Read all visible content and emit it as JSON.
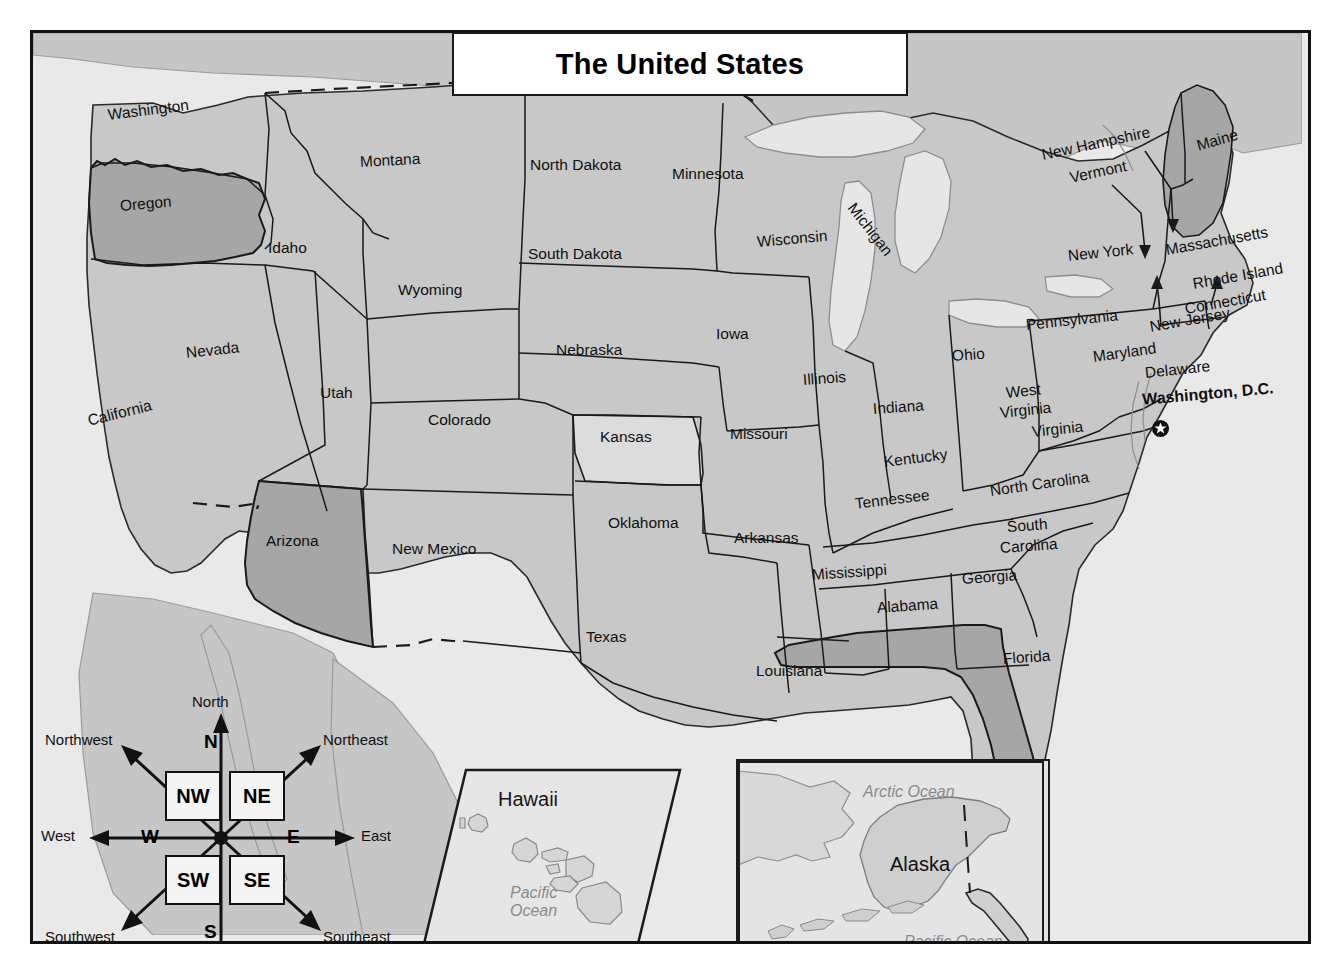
{
  "title": {
    "text": "The United States"
  },
  "colors": {
    "land_base": "#c8c8c8",
    "highlight_state": "#a6a6a6",
    "light_state": "#dcdcdc",
    "ocean": "#e9e9e9",
    "lake": "#e6e6e6",
    "border": "#1a1a1a",
    "ocean_label": "#8a8a8a"
  },
  "states": [
    {
      "name": "Washington",
      "x": 108,
      "y": 106,
      "rot": -7,
      "size": "lbl"
    },
    {
      "name": "Oregon",
      "x": 120,
      "y": 197,
      "rot": -5,
      "size": "lbl"
    },
    {
      "name": "Idaho",
      "x": 268,
      "y": 239,
      "rot": 0,
      "size": "lbl"
    },
    {
      "name": "Montana",
      "x": 360,
      "y": 153,
      "rot": -3,
      "size": "lbl"
    },
    {
      "name": "Wyoming",
      "x": 398,
      "y": 281,
      "rot": 0,
      "size": "lbl"
    },
    {
      "name": "Nevada",
      "x": 186,
      "y": 344,
      "rot": -6,
      "size": "lbl"
    },
    {
      "name": "Utah",
      "x": 320,
      "y": 384,
      "rot": 0,
      "size": "lbl"
    },
    {
      "name": "California",
      "x": 88,
      "y": 412,
      "rot": -14,
      "size": "lbl"
    },
    {
      "name": "Arizona",
      "x": 266,
      "y": 532,
      "rot": 0,
      "size": "lbl"
    },
    {
      "name": "Colorado",
      "x": 428,
      "y": 411,
      "rot": 0,
      "size": "lbl"
    },
    {
      "name": "New Mexico",
      "x": 392,
      "y": 540,
      "rot": 0,
      "size": "lbl"
    },
    {
      "name": "North Dakota",
      "x": 530,
      "y": 156,
      "rot": 0,
      "size": "lbl"
    },
    {
      "name": "South Dakota",
      "x": 528,
      "y": 245,
      "rot": 0,
      "size": "lbl"
    },
    {
      "name": "Nebraska",
      "x": 556,
      "y": 341,
      "rot": 0,
      "size": "lbl"
    },
    {
      "name": "Kansas",
      "x": 600,
      "y": 428,
      "rot": 0,
      "size": "lbl"
    },
    {
      "name": "Oklahoma",
      "x": 608,
      "y": 514,
      "rot": 0,
      "size": "lbl"
    },
    {
      "name": "Texas",
      "x": 586,
      "y": 628,
      "rot": 0,
      "size": "lbl"
    },
    {
      "name": "Minnesota",
      "x": 672,
      "y": 165,
      "rot": 0,
      "size": "lbl"
    },
    {
      "name": "Iowa",
      "x": 716,
      "y": 325,
      "rot": 0,
      "size": "lbl"
    },
    {
      "name": "Missouri",
      "x": 730,
      "y": 425,
      "rot": 0,
      "size": "lbl"
    },
    {
      "name": "Arkansas",
      "x": 734,
      "y": 529,
      "rot": 0,
      "size": "lbl"
    },
    {
      "name": "Louisiana",
      "x": 756,
      "y": 662,
      "rot": 0,
      "size": "lbl"
    },
    {
      "name": "Wisconsin",
      "x": 757,
      "y": 233,
      "rot": -5,
      "size": "lbl"
    },
    {
      "name": "Illinois",
      "x": 803,
      "y": 371,
      "rot": -4,
      "size": "lbl"
    },
    {
      "name": "Michigan",
      "x": 851,
      "y": 196,
      "rot": 52,
      "size": "lbl"
    },
    {
      "name": "Indiana",
      "x": 873,
      "y": 400,
      "rot": -4,
      "size": "lbl"
    },
    {
      "name": "Ohio",
      "x": 952,
      "y": 347,
      "rot": -4,
      "size": "lbl"
    },
    {
      "name": "Kentucky",
      "x": 884,
      "y": 453,
      "rot": -7,
      "size": "lbl"
    },
    {
      "name": "Tennessee",
      "x": 855,
      "y": 495,
      "rot": -7,
      "size": "lbl"
    },
    {
      "name": "Mississippi",
      "x": 812,
      "y": 566,
      "rot": -4,
      "size": "lbl"
    },
    {
      "name": "Alabama",
      "x": 877,
      "y": 599,
      "rot": -4,
      "size": "lbl"
    },
    {
      "name": "Georgia",
      "x": 962,
      "y": 570,
      "rot": -4,
      "size": "lbl"
    },
    {
      "name": "Florida",
      "x": 1003,
      "y": 650,
      "rot": -4,
      "size": "lbl"
    },
    {
      "name": "South",
      "x": 1007,
      "y": 518,
      "rot": -4,
      "size": "lbl"
    },
    {
      "name": "Carolina",
      "x": 1000,
      "y": 539,
      "rot": -4,
      "size": "lbl"
    },
    {
      "name": "North Carolina",
      "x": 990,
      "y": 482,
      "rot": -8,
      "size": "lbl"
    },
    {
      "name": "Virginia",
      "x": 1032,
      "y": 423,
      "rot": -6,
      "size": "lbl"
    },
    {
      "name": "West",
      "x": 1006,
      "y": 384,
      "rot": -6,
      "size": "lbl"
    },
    {
      "name": "Virginia",
      "x": 1000,
      "y": 404,
      "rot": -6,
      "size": "lbl"
    },
    {
      "name": "Pennsylvania",
      "x": 1026,
      "y": 316,
      "rot": -6,
      "size": "lbl"
    },
    {
      "name": "New York",
      "x": 1068,
      "y": 247,
      "rot": -6,
      "size": "lbl"
    },
    {
      "name": "Maryland",
      "x": 1093,
      "y": 348,
      "rot": -8,
      "size": "lbl"
    },
    {
      "name": "Delaware",
      "x": 1145,
      "y": 364,
      "rot": -6,
      "size": "lbl"
    },
    {
      "name": "New Jersey",
      "x": 1150,
      "y": 318,
      "rot": -10,
      "size": "lbl"
    },
    {
      "name": "Connecticut",
      "x": 1185,
      "y": 300,
      "rot": -10,
      "size": "lbl"
    },
    {
      "name": "Rhode Island",
      "x": 1193,
      "y": 275,
      "rot": -10,
      "size": "lbl"
    },
    {
      "name": "Massachusetts",
      "x": 1166,
      "y": 241,
      "rot": -10,
      "size": "lbl"
    },
    {
      "name": "Vermont",
      "x": 1070,
      "y": 169,
      "rot": -12,
      "size": "lbl"
    },
    {
      "name": "New Hampshire",
      "x": 1042,
      "y": 146,
      "rot": -12,
      "size": "lbl"
    },
    {
      "name": "Maine",
      "x": 1197,
      "y": 137,
      "rot": -16,
      "size": "lbl"
    }
  ],
  "capital": {
    "label": "Washington, D.C.",
    "marker": "star-circle-icon",
    "x": 1142,
    "y": 385
  },
  "highlighted_states": [
    "Oregon",
    "Arizona",
    "Maine",
    "Florida"
  ],
  "light_states": [
    "Kansas"
  ],
  "insets": {
    "hawaii": {
      "title": "Hawaii",
      "ocean_label": "Pacific\nOcean",
      "ocean_line1": "Pacific",
      "ocean_line2": "Ocean"
    },
    "alaska": {
      "title": "Alaska",
      "ocean_north": "Arctic Ocean",
      "ocean_south": "Pacific Ocean"
    }
  },
  "compass": {
    "center_letters": {
      "n": "N",
      "s": "S",
      "e": "E",
      "w": "W"
    },
    "quadrant_boxes": {
      "nw": "NW",
      "ne": "NE",
      "sw": "SW",
      "se": "SE"
    },
    "outer_labels": {
      "north": "North",
      "south": "South",
      "east": "East",
      "west": "West",
      "northwest": "Northwest",
      "northeast": "Northeast",
      "southwest": "Southwest",
      "southeast": "Southeast"
    }
  }
}
